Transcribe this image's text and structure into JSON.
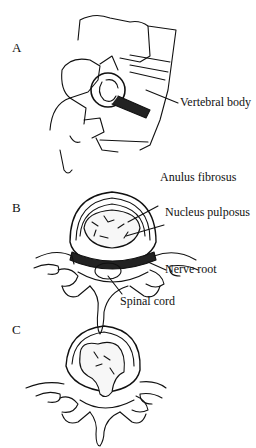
{
  "figure": {
    "panels": [
      {
        "letter": "A",
        "labels": [
          "Vertebral body"
        ]
      },
      {
        "letter": "B",
        "labels": [
          "Anulus fibrosus",
          "Nucleus pulposus",
          "Nerve root",
          "Spinal cord"
        ]
      },
      {
        "letter": "C",
        "labels": []
      }
    ]
  }
}
